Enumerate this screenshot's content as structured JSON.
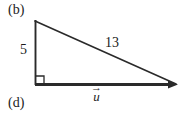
{
  "figure": {
    "panel_label_top": "(b)",
    "panel_label_bottom": "(d)",
    "background_color": "#ffffff",
    "stroke_color": "#2a2a2a",
    "text_color": "#1b1b1b",
    "labels": {
      "vertical_leg": "5",
      "hypotenuse": "13",
      "vector_name": "u",
      "vector_arrow": "→"
    },
    "geometry": {
      "apex": [
        35,
        21
      ],
      "right_angle_vertex": [
        35,
        85
      ],
      "far_vertex": [
        176,
        84
      ],
      "right_angle_marker_size": 8,
      "vector_direction": "left-to-right",
      "arrowhead_at": [
        176,
        84
      ]
    }
  }
}
